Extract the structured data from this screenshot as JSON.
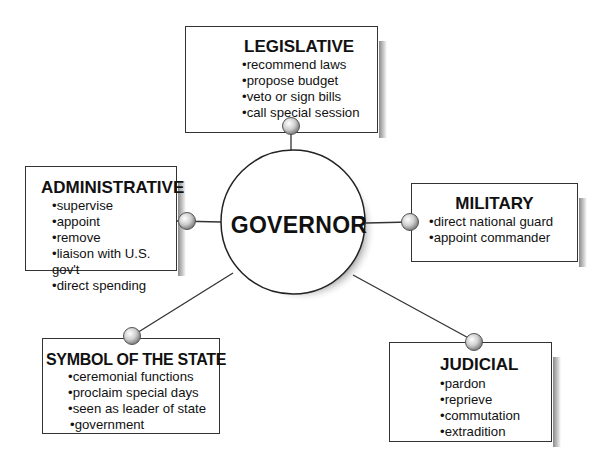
{
  "center": {
    "label": "GOVERNOR"
  },
  "roles": [
    {
      "id": "legislative",
      "title": "LEGISLATIVE",
      "items": [
        "recommend laws",
        "propose budget",
        "veto or sign bills",
        "call special session"
      ]
    },
    {
      "id": "administrative",
      "title": "ADMINISTRATIVE",
      "items": [
        "supervise",
        "appoint",
        "remove",
        "liaison with U.S. gov't",
        "direct spending"
      ]
    },
    {
      "id": "military",
      "title": "MILITARY",
      "items": [
        "direct national guard",
        "appoint commander"
      ]
    },
    {
      "id": "symbol",
      "title": "SYMBOL OF THE STATE",
      "items": [
        "ceremonial functions",
        "proclaim special days",
        "seen as leader of state",
        "government"
      ]
    },
    {
      "id": "judicial",
      "title": "JUDICIAL",
      "items": [
        "pardon",
        "reprieve",
        "commutation",
        "extradition"
      ]
    }
  ],
  "colors": {
    "line": "#333333",
    "node": "#c8c8c8",
    "shadow": "#8a8a8a"
  }
}
